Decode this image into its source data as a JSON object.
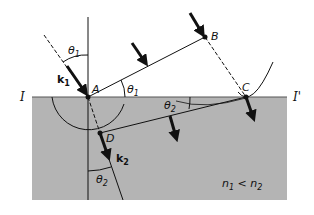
{
  "figure": {
    "type": "refraction-huygens-construction",
    "colors": {
      "background": "#ffffff",
      "medium2_fill": "#b4b4b4",
      "line": "#111111"
    },
    "labels": {
      "interface_left": "I",
      "interface_right": "I'",
      "point_A": "A",
      "point_B": "B",
      "point_C": "C",
      "point_D": "D",
      "k1": "k",
      "k1_sub": "1",
      "k2": "k",
      "k2_sub": "2",
      "theta1_top": "θ",
      "theta1_top_sub": "1",
      "theta1_wavefront": "θ",
      "theta1_wavefront_sub": "1",
      "theta2_interface": "θ",
      "theta2_interface_sub": "2",
      "theta2_bottom": "θ",
      "theta2_bottom_sub": "2",
      "condition_n1": "n",
      "condition_n1_sub": "1",
      "condition_lt": " < ",
      "condition_n2": "n",
      "condition_n2_sub": "2"
    }
  }
}
